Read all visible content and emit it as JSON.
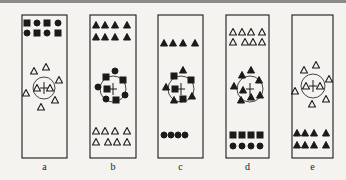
{
  "colors": {
    "stroke": "#1a1a1a",
    "background": "#f4f3f0"
  },
  "panels": [
    {
      "label": "a",
      "x": 22,
      "w": 45,
      "top": [
        {
          "shape": "square",
          "fill": true,
          "x": 27,
          "y": 23
        },
        {
          "shape": "circle",
          "fill": true,
          "x": 37,
          "y": 23
        },
        {
          "shape": "square",
          "fill": true,
          "x": 47,
          "y": 23
        },
        {
          "shape": "circle",
          "fill": true,
          "x": 58,
          "y": 23
        },
        {
          "shape": "circle",
          "fill": true,
          "x": 27,
          "y": 33
        },
        {
          "shape": "square",
          "fill": true,
          "x": 37,
          "y": 33
        },
        {
          "shape": "circle",
          "fill": true,
          "x": 47,
          "y": 33
        },
        {
          "shape": "square",
          "fill": true,
          "x": 58,
          "y": 33
        }
      ],
      "center": {
        "cx": 44,
        "cy": 88,
        "r": 11
      },
      "cluster": [
        {
          "shape": "triangle",
          "fill": false,
          "x": 34,
          "y": 71
        },
        {
          "shape": "triangle",
          "fill": false,
          "x": 46,
          "y": 67
        },
        {
          "shape": "triangle",
          "fill": false,
          "x": 59,
          "y": 80
        },
        {
          "shape": "triangle",
          "fill": false,
          "x": 37,
          "y": 88
        },
        {
          "shape": "triangle",
          "fill": false,
          "x": 50,
          "y": 88
        },
        {
          "shape": "triangle",
          "fill": false,
          "x": 26,
          "y": 93
        },
        {
          "shape": "triangle",
          "fill": false,
          "x": 55,
          "y": 100
        },
        {
          "shape": "triangle",
          "fill": false,
          "x": 41,
          "y": 107
        }
      ],
      "bottom": []
    },
    {
      "label": "b",
      "x": 90,
      "w": 46,
      "top": [
        {
          "shape": "triangle",
          "fill": true,
          "x": 96,
          "y": 25
        },
        {
          "shape": "triangle",
          "fill": true,
          "x": 105,
          "y": 25
        },
        {
          "shape": "triangle",
          "fill": true,
          "x": 115,
          "y": 25
        },
        {
          "shape": "triangle",
          "fill": true,
          "x": 127,
          "y": 25
        },
        {
          "shape": "triangle",
          "fill": true,
          "x": 96,
          "y": 37
        },
        {
          "shape": "triangle",
          "fill": true,
          "x": 105,
          "y": 37
        },
        {
          "shape": "triangle",
          "fill": true,
          "x": 115,
          "y": 37
        },
        {
          "shape": "triangle",
          "fill": true,
          "x": 127,
          "y": 37
        }
      ],
      "center": {
        "cx": 113,
        "cy": 89,
        "r": 13
      },
      "cluster": [
        {
          "shape": "circle",
          "fill": true,
          "x": 115,
          "y": 71
        },
        {
          "shape": "square",
          "fill": true,
          "x": 106,
          "y": 77
        },
        {
          "shape": "square",
          "fill": true,
          "x": 123,
          "y": 80
        },
        {
          "shape": "circle",
          "fill": true,
          "x": 98,
          "y": 87
        },
        {
          "shape": "square",
          "fill": true,
          "x": 107,
          "y": 89
        },
        {
          "shape": "circle",
          "fill": true,
          "x": 125,
          "y": 95
        },
        {
          "shape": "circle",
          "fill": true,
          "x": 106,
          "y": 99
        },
        {
          "shape": "square",
          "fill": true,
          "x": 116,
          "y": 100
        }
      ],
      "bottom": [
        {
          "shape": "triangle",
          "fill": false,
          "x": 96,
          "y": 131
        },
        {
          "shape": "triangle",
          "fill": false,
          "x": 105,
          "y": 131
        },
        {
          "shape": "triangle",
          "fill": false,
          "x": 115,
          "y": 131
        },
        {
          "shape": "triangle",
          "fill": false,
          "x": 127,
          "y": 131
        },
        {
          "shape": "triangle",
          "fill": false,
          "x": 96,
          "y": 142
        },
        {
          "shape": "triangle",
          "fill": false,
          "x": 108,
          "y": 142
        },
        {
          "shape": "triangle",
          "fill": false,
          "x": 117,
          "y": 142
        },
        {
          "shape": "triangle",
          "fill": false,
          "x": 127,
          "y": 142
        }
      ]
    },
    {
      "label": "c",
      "x": 158,
      "w": 45,
      "top": [
        {
          "shape": "triangle",
          "fill": true,
          "x": 164,
          "y": 43
        },
        {
          "shape": "triangle",
          "fill": true,
          "x": 173,
          "y": 43
        },
        {
          "shape": "triangle",
          "fill": true,
          "x": 183,
          "y": 43
        },
        {
          "shape": "triangle",
          "fill": true,
          "x": 195,
          "y": 43
        }
      ],
      "center": {
        "cx": 181,
        "cy": 89,
        "r": 13
      },
      "cluster": [
        {
          "shape": "triangle",
          "fill": true,
          "x": 183,
          "y": 70
        },
        {
          "shape": "square",
          "fill": true,
          "x": 174,
          "y": 76
        },
        {
          "shape": "square",
          "fill": true,
          "x": 191,
          "y": 80
        },
        {
          "shape": "triangle",
          "fill": true,
          "x": 166,
          "y": 87
        },
        {
          "shape": "square",
          "fill": true,
          "x": 175,
          "y": 89
        },
        {
          "shape": "triangle",
          "fill": true,
          "x": 192,
          "y": 96
        },
        {
          "shape": "triangle",
          "fill": true,
          "x": 174,
          "y": 100
        },
        {
          "shape": "square",
          "fill": true,
          "x": 183,
          "y": 99
        }
      ],
      "bottom": [
        {
          "shape": "circle",
          "fill": true,
          "x": 164,
          "y": 135
        },
        {
          "shape": "circle",
          "fill": true,
          "x": 171,
          "y": 135
        },
        {
          "shape": "circle",
          "fill": true,
          "x": 178,
          "y": 135
        },
        {
          "shape": "circle",
          "fill": true,
          "x": 185,
          "y": 135
        }
      ]
    },
    {
      "label": "d",
      "x": 226,
      "w": 43,
      "top": [
        {
          "shape": "triangle",
          "fill": false,
          "x": 233,
          "y": 32
        },
        {
          "shape": "triangle",
          "fill": false,
          "x": 242,
          "y": 32
        },
        {
          "shape": "triangle",
          "fill": false,
          "x": 251,
          "y": 32
        },
        {
          "shape": "triangle",
          "fill": false,
          "x": 262,
          "y": 32
        },
        {
          "shape": "triangle",
          "fill": false,
          "x": 233,
          "y": 42
        },
        {
          "shape": "triangle",
          "fill": false,
          "x": 245,
          "y": 42
        },
        {
          "shape": "triangle",
          "fill": false,
          "x": 253,
          "y": 42
        },
        {
          "shape": "triangle",
          "fill": false,
          "x": 262,
          "y": 42
        }
      ],
      "center": {
        "cx": 250,
        "cy": 89,
        "r": 13
      },
      "cluster": [
        {
          "shape": "triangle",
          "fill": true,
          "x": 251,
          "y": 70
        },
        {
          "shape": "triangle",
          "fill": true,
          "x": 242,
          "y": 75
        },
        {
          "shape": "triangle",
          "fill": true,
          "x": 259,
          "y": 80
        },
        {
          "shape": "triangle",
          "fill": true,
          "x": 234,
          "y": 86
        },
        {
          "shape": "triangle",
          "fill": true,
          "x": 243,
          "y": 90
        },
        {
          "shape": "triangle",
          "fill": true,
          "x": 260,
          "y": 95
        },
        {
          "shape": "triangle",
          "fill": true,
          "x": 241,
          "y": 100
        },
        {
          "shape": "triangle",
          "fill": true,
          "x": 251,
          "y": 97
        }
      ],
      "bottom": [
        {
          "shape": "square",
          "fill": true,
          "x": 233,
          "y": 135
        },
        {
          "shape": "square",
          "fill": true,
          "x": 242,
          "y": 135
        },
        {
          "shape": "square",
          "fill": true,
          "x": 251,
          "y": 135
        },
        {
          "shape": "square",
          "fill": true,
          "x": 260,
          "y": 135
        },
        {
          "shape": "circle",
          "fill": true,
          "x": 233,
          "y": 146
        },
        {
          "shape": "circle",
          "fill": true,
          "x": 242,
          "y": 146
        },
        {
          "shape": "circle",
          "fill": true,
          "x": 251,
          "y": 146
        },
        {
          "shape": "circle",
          "fill": true,
          "x": 260,
          "y": 146
        }
      ]
    },
    {
      "label": "e",
      "x": 292,
      "w": 41,
      "top": [],
      "center": {
        "cx": 313,
        "cy": 86,
        "r": 12
      },
      "cluster": [
        {
          "shape": "triangle",
          "fill": false,
          "x": 304,
          "y": 70
        },
        {
          "shape": "triangle",
          "fill": false,
          "x": 316,
          "y": 65
        },
        {
          "shape": "triangle",
          "fill": false,
          "x": 329,
          "y": 79
        },
        {
          "shape": "triangle",
          "fill": false,
          "x": 306,
          "y": 86
        },
        {
          "shape": "triangle",
          "fill": false,
          "x": 320,
          "y": 86
        },
        {
          "shape": "triangle",
          "fill": false,
          "x": 295,
          "y": 91
        },
        {
          "shape": "triangle",
          "fill": false,
          "x": 326,
          "y": 99
        },
        {
          "shape": "triangle",
          "fill": false,
          "x": 312,
          "y": 104
        }
      ],
      "bottom": [
        {
          "shape": "triangle",
          "fill": true,
          "x": 297,
          "y": 133
        },
        {
          "shape": "triangle",
          "fill": true,
          "x": 305,
          "y": 133
        },
        {
          "shape": "triangle",
          "fill": true,
          "x": 314,
          "y": 133
        },
        {
          "shape": "triangle",
          "fill": true,
          "x": 326,
          "y": 133
        },
        {
          "shape": "triangle",
          "fill": true,
          "x": 297,
          "y": 145
        },
        {
          "shape": "triangle",
          "fill": true,
          "x": 305,
          "y": 145
        },
        {
          "shape": "triangle",
          "fill": true,
          "x": 314,
          "y": 145
        },
        {
          "shape": "triangle",
          "fill": true,
          "x": 326,
          "y": 145
        }
      ]
    }
  ],
  "layout": {
    "panel_top": 15,
    "panel_bottom": 158,
    "label_y": 170
  }
}
